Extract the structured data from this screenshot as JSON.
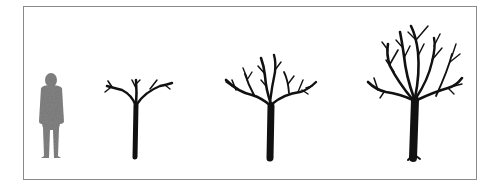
{
  "figure": {
    "colors": {
      "frame_border": "#8a8a8a",
      "background": "#ffffff",
      "person": "#808080",
      "tree": "#111111"
    },
    "items": [
      {
        "name": "person",
        "label": "human silhouette for scale"
      },
      {
        "name": "tree-small",
        "label": "young tree"
      },
      {
        "name": "tree-medium",
        "label": "medium tree"
      },
      {
        "name": "tree-large",
        "label": "mature tree"
      }
    ]
  }
}
